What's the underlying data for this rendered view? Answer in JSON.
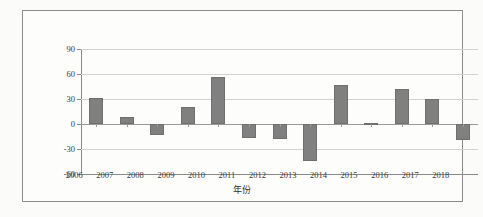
{
  "figure": {
    "background_color": "#fbfbfa",
    "frame_color": "#8c8c8c",
    "bar_color": "#808080",
    "gridline_color": "#d2d2d2",
    "axis_color": "#8a8a8a"
  },
  "chart_data": {
    "type": "bar",
    "title": "",
    "xlabel": "年份",
    "ylabel": "",
    "categories": [
      "2006",
      "2007",
      "2008",
      "2009",
      "2010",
      "2011",
      "2012",
      "2013",
      "2014",
      "2015",
      "2016",
      "2017",
      "2018"
    ],
    "values": [
      31,
      8,
      -13,
      21,
      56,
      -17,
      -18,
      -44,
      47,
      1.5,
      42,
      30,
      -19
    ],
    "ylim": [
      -60,
      90
    ],
    "yticks": [
      90,
      60,
      30,
      0,
      -30,
      -60
    ],
    "ytick_labels": [
      "90",
      "60",
      "30",
      "0",
      "-30",
      "-60"
    ],
    "grid": true,
    "legend": "none"
  }
}
